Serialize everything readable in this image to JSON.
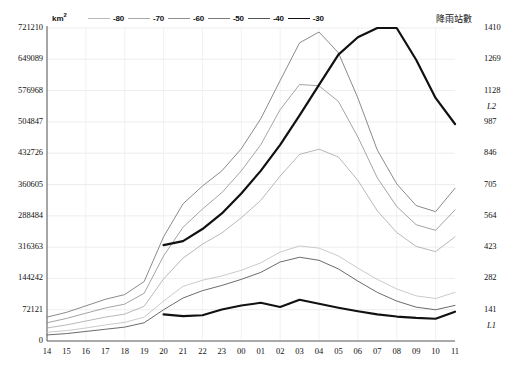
{
  "axes": {
    "left_unit": "km",
    "left_unit_sup": "2",
    "right_title": "降雨站數",
    "left_ticks": [
      "721210",
      "649089",
      "576968",
      "504847",
      "432726",
      "360605",
      "288484",
      "316363",
      "144242",
      "72121",
      "0"
    ],
    "left_min": 0,
    "left_max": 721210,
    "right_ticks": [
      "1410",
      "1269",
      "1128",
      "987",
      "846",
      "705",
      "564",
      "423",
      "282",
      "141",
      ""
    ],
    "right_min": 0,
    "right_max": 1410,
    "x_ticks": [
      "14",
      "15",
      "16",
      "17",
      "18",
      "19",
      "20",
      "21",
      "22",
      "23",
      "00",
      "01",
      "02",
      "03",
      "04",
      "05",
      "06",
      "07",
      "08",
      "09",
      "10",
      "11"
    ]
  },
  "legend": {
    "items": [
      {
        "label": "-80",
        "color": "#b9b9b9",
        "width": 0.8
      },
      {
        "label": "-70",
        "color": "#a8a8a8",
        "width": 0.8
      },
      {
        "label": "-60",
        "color": "#8f8f8f",
        "width": 0.8
      },
      {
        "label": "-50",
        "color": "#7a7a7a",
        "width": 0.8
      },
      {
        "label": "-40",
        "color": "#555555",
        "width": 0.9
      },
      {
        "label": "-30",
        "color": "#111111",
        "width": 1.9
      }
    ]
  },
  "annotations": {
    "L1": "L1",
    "L2": "L2"
  },
  "chart_data": {
    "type": "line",
    "title": "",
    "subtitle": "",
    "xlabel": "",
    "ylabel": "km2",
    "y2label": "降雨站數",
    "grid": true,
    "legend_position": "top",
    "ylim": [
      0,
      721210
    ],
    "y2lim": [
      0,
      1410
    ],
    "x": [
      "14",
      "15",
      "16",
      "17",
      "18",
      "19",
      "20",
      "21",
      "22",
      "23",
      "00",
      "01",
      "02",
      "03",
      "04",
      "05",
      "06",
      "07",
      "08",
      "09",
      "10",
      "11"
    ],
    "series": [
      {
        "name": "-80",
        "color": "#bcbcbc",
        "width": 0.8,
        "axis": "left",
        "values": [
          20000,
          24000,
          30000,
          37000,
          43000,
          55000,
          92000,
          126000,
          140000,
          150000,
          163000,
          180000,
          205000,
          219000,
          214000,
          196000,
          168000,
          142000,
          120000,
          104000,
          98000,
          112000
        ]
      },
      {
        "name": "-70",
        "color": "#a6a6a6",
        "width": 0.8,
        "axis": "left",
        "values": [
          30000,
          37000,
          46000,
          55000,
          62000,
          80000,
          143000,
          191000,
          223000,
          249000,
          284000,
          324000,
          380000,
          430000,
          442000,
          424000,
          370000,
          300000,
          250000,
          218000,
          206000,
          240000
        ]
      },
      {
        "name": "-60",
        "color": "#8d8d8d",
        "width": 0.8,
        "axis": "left",
        "values": [
          42000,
          52000,
          64000,
          76000,
          85000,
          110000,
          196000,
          262000,
          304000,
          342000,
          392000,
          452000,
          533000,
          591000,
          588000,
          552000,
          470000,
          376000,
          310000,
          268000,
          255000,
          302000
        ]
      },
      {
        "name": "-50",
        "color": "#7d7d7d",
        "width": 0.9,
        "axis": "left",
        "values": [
          55000,
          66000,
          81000,
          96000,
          107000,
          137000,
          240000,
          316000,
          357000,
          392000,
          443000,
          512000,
          600000,
          687000,
          712000,
          664000,
          560000,
          440000,
          362000,
          312000,
          298000,
          352000
        ]
      },
      {
        "name": "-40",
        "color": "#5a5a5a",
        "width": 0.9,
        "axis": "left",
        "values": [
          14000,
          17000,
          22000,
          27000,
          32000,
          42000,
          72000,
          99000,
          116000,
          128000,
          142000,
          158000,
          182000,
          193000,
          186000,
          166000,
          138000,
          112000,
          92000,
          78000,
          72000,
          82000
        ]
      },
      {
        "name": "-30",
        "color": "#111111",
        "width": 2.1,
        "axis": "right",
        "start_index": 6,
        "values": [
          null,
          null,
          null,
          null,
          null,
          null,
          120,
          112,
          116,
          142,
          160,
          172,
          153,
          186,
          168,
          150,
          134,
          120,
          110,
          104,
          100,
          132
        ]
      },
      {
        "name": "L2",
        "color": "#111111",
        "width": 2.2,
        "axis": "left",
        "start_index": 6,
        "values": [
          null,
          null,
          null,
          null,
          null,
          null,
          221000,
          230000,
          258000,
          294000,
          340000,
          392000,
          452000,
          520000,
          590000,
          660000,
          700000,
          721210,
          721210,
          648000,
          560000,
          500000
        ]
      }
    ]
  }
}
